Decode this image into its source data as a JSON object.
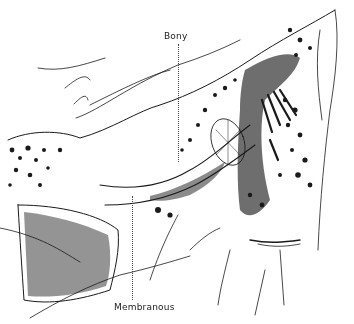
{
  "figure": {
    "type": "anatomical line drawing",
    "labels": {
      "bony": "Bony",
      "membranous": "Membranous"
    },
    "colors": {
      "ink": "#1a1a1a",
      "background": "#ffffff"
    }
  }
}
